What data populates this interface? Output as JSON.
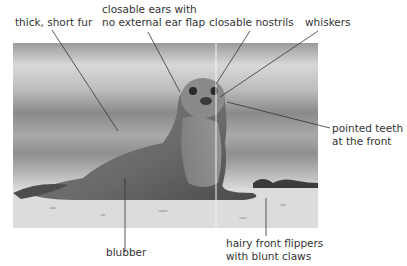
{
  "figure": {
    "photo_style": "grayscale photograph of a seal sitting on a beach",
    "labels": [
      {
        "id": "fur",
        "lines": [
          "thick, short fur"
        ]
      },
      {
        "id": "ears",
        "lines": [
          "closable ears with",
          "no external ear flap"
        ]
      },
      {
        "id": "nostrils",
        "lines": [
          "closable nostrils"
        ]
      },
      {
        "id": "whiskers",
        "lines": [
          "whiskers"
        ]
      },
      {
        "id": "teeth",
        "lines": [
          "pointed teeth",
          "at the front"
        ]
      },
      {
        "id": "blubber",
        "lines": [
          "blubber"
        ]
      },
      {
        "id": "flippers",
        "lines": [
          "hairy front flippers",
          "with blunt claws"
        ]
      }
    ]
  },
  "colors": {
    "label_text": "#333333",
    "leader_line": "#333333",
    "background": "#ffffff"
  }
}
